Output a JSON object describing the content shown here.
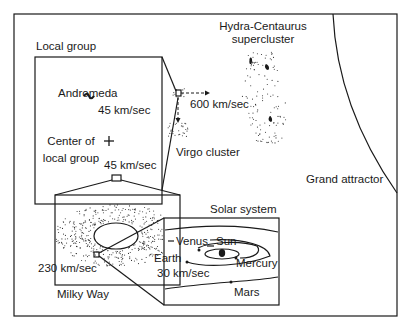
{
  "figure": {
    "colors": {
      "ink": "#1a1a1a",
      "background": "#ffffff"
    }
  },
  "labels": {
    "local_group_title": "Local group",
    "andromeda": "Andromeda",
    "andromeda_speed": "45 km/sec",
    "center_of_local_group_line1": "Center of",
    "center_of_local_group_line2": "local group",
    "milky_way_speed_in_group": "45 km/sec",
    "virgo_cluster": "Virgo cluster",
    "virgo_flow_speed": "600 km/sec",
    "hydra_centaurus_line1": "Hydra-Centaurus",
    "hydra_centaurus_line2": "supercluster",
    "grand_attractor": "Grand attractor",
    "solar_system_title": "Solar system",
    "venus": "Venus",
    "sun": "Sun",
    "earth": "Earth",
    "mercury": "Mercury",
    "earth_speed": "30 km/sec",
    "mars": "Mars",
    "sun_galactic_speed": "230 km/sec",
    "milky_way": "Milky Way"
  },
  "symbols": {
    "center_marker": "+",
    "andromeda_icon": "spiral-galaxy-icon"
  }
}
